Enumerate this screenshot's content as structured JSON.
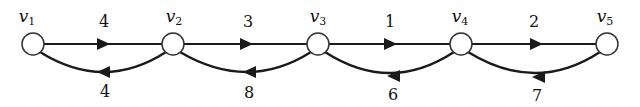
{
  "diagram": {
    "type": "directed-graph",
    "nodes": [
      {
        "id": "v1",
        "label": "v",
        "sub": "1",
        "x": 33,
        "y": 44
      },
      {
        "id": "v2",
        "label": "v",
        "sub": "2",
        "x": 173,
        "y": 44
      },
      {
        "id": "v3",
        "label": "v",
        "sub": "3",
        "x": 318,
        "y": 44
      },
      {
        "id": "v4",
        "label": "v",
        "sub": "4",
        "x": 461,
        "y": 44
      },
      {
        "id": "v5",
        "label": "v",
        "sub": "5",
        "x": 607,
        "y": 44
      }
    ],
    "edges": [
      {
        "from": "v1",
        "to": "v2",
        "weight": "4",
        "style": "straight"
      },
      {
        "from": "v2",
        "to": "v3",
        "weight": "3",
        "style": "straight"
      },
      {
        "from": "v3",
        "to": "v4",
        "weight": "1",
        "style": "straight"
      },
      {
        "from": "v4",
        "to": "v5",
        "weight": "2",
        "style": "straight"
      },
      {
        "from": "v2",
        "to": "v1",
        "weight": "4",
        "style": "curved-below"
      },
      {
        "from": "v3",
        "to": "v2",
        "weight": "8",
        "style": "curved-below"
      },
      {
        "from": "v4",
        "to": "v3",
        "weight": "6",
        "style": "curved-below"
      },
      {
        "from": "v5",
        "to": "v4",
        "weight": "7",
        "style": "curved-below"
      }
    ],
    "colors": {
      "stroke": "#1a1a1a",
      "node_fill": "#ffffff"
    }
  }
}
